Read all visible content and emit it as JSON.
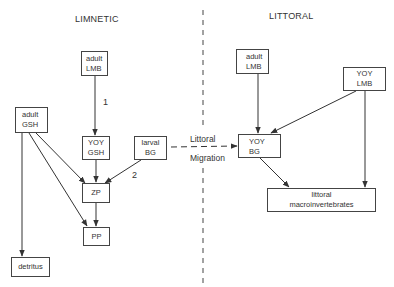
{
  "regions": {
    "left": "LIMNETIC",
    "right": "LITTORAL"
  },
  "nodes": {
    "adult_lmb_limnetic": {
      "lines": [
        "adult",
        "LMB"
      ]
    },
    "adult_gsh": {
      "lines": [
        "adult",
        "GSH"
      ]
    },
    "yoy_gsh": {
      "lines": [
        "YOY",
        "GSH"
      ]
    },
    "larval_bg": {
      "lines": [
        "larval",
        "BG"
      ]
    },
    "zp": {
      "lines": [
        "ZP"
      ]
    },
    "pp": {
      "lines": [
        "PP"
      ]
    },
    "detritus": {
      "lines": [
        "detritus"
      ]
    },
    "adult_lmb_littoral": {
      "lines": [
        "adult",
        "LMB"
      ]
    },
    "yoy_lmb": {
      "lines": [
        "YOY",
        "LMB"
      ]
    },
    "yoy_bg": {
      "lines": [
        "YOY",
        "BG"
      ]
    },
    "littoral_macro": {
      "lines": [
        "littoral",
        "macroinvertebrates"
      ]
    }
  },
  "edge_labels": {
    "one": "1",
    "two": "2"
  },
  "migration": {
    "top": "Littoral",
    "bottom": "Migration"
  },
  "edges": [
    {
      "from": "adult LMB (limnetic)",
      "to": "YOY GSH",
      "label": "1"
    },
    {
      "from": "adult GSH",
      "to": "ZP"
    },
    {
      "from": "adult GSH",
      "to": "PP"
    },
    {
      "from": "adult GSH",
      "to": "detritus"
    },
    {
      "from": "YOY GSH",
      "to": "ZP"
    },
    {
      "from": "larval BG",
      "to": "ZP",
      "label": "2"
    },
    {
      "from": "ZP",
      "to": "PP"
    },
    {
      "from": "larval BG",
      "to": "YOY BG",
      "style": "dashed",
      "label": "Littoral Migration"
    },
    {
      "from": "adult LMB (littoral)",
      "to": "YOY BG"
    },
    {
      "from": "YOY LMB",
      "to": "YOY BG"
    },
    {
      "from": "YOY LMB",
      "to": "littoral macroinvertebrates"
    },
    {
      "from": "YOY BG",
      "to": "littoral macroinvertebrates"
    }
  ],
  "colors": {
    "line": "#333333",
    "box_border": "#444444",
    "background": "#ffffff"
  }
}
